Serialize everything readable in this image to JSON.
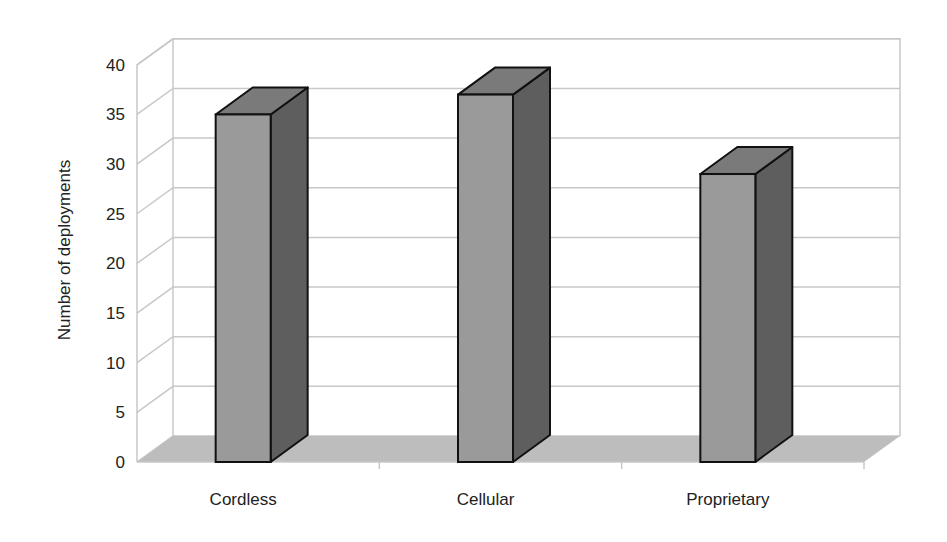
{
  "chart_data": {
    "type": "bar",
    "style": "3d-column",
    "title": "",
    "xlabel": "",
    "ylabel": "Number of deployments",
    "categories": [
      "Cordless",
      "Cellular",
      "Proprietary"
    ],
    "values": [
      35,
      37,
      29
    ],
    "yticks": [
      "0",
      "5",
      "10",
      "15",
      "20",
      "25",
      "30",
      "35",
      "40"
    ],
    "ylim": [
      0,
      40
    ],
    "grid": true,
    "legend": null,
    "colors": {
      "bar_front": "#9a9a9a",
      "bar_side": "#5e5e5e",
      "bar_top": "#7a7a7a",
      "floor": "#bdbdbd",
      "grid": "#c8c8c8",
      "outline": "#111111"
    }
  }
}
